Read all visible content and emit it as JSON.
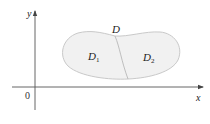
{
  "diagram": {
    "type": "region-decomposition",
    "axes": {
      "x_label": "x",
      "y_label": "y",
      "origin_label": "0"
    },
    "region": {
      "label": "D",
      "subregions": [
        {
          "label": "D",
          "subscript": "1"
        },
        {
          "label": "D",
          "subscript": "2"
        }
      ],
      "fill_color": "#f1f1f1",
      "border_color": "#c8c8c8"
    },
    "axis_color": "#555555"
  }
}
